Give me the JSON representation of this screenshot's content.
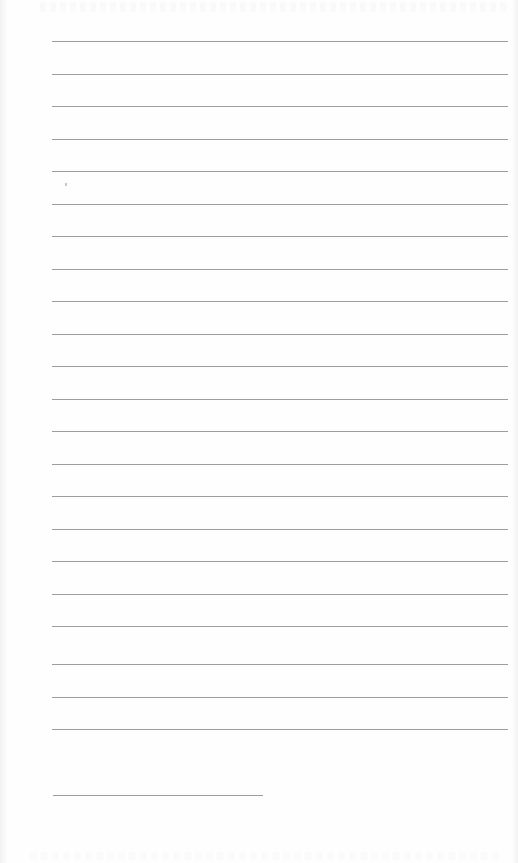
{
  "page": {
    "type": "blank lined page",
    "background": "#fefefe",
    "rule_color": "#8c8c8c",
    "rule_left": 52,
    "rule_right": 508,
    "rule_ys": [
      41,
      74,
      106,
      139,
      171,
      204,
      236,
      269,
      301,
      334,
      366,
      399,
      431,
      464,
      496,
      529,
      561,
      594,
      626,
      664,
      697,
      729
    ],
    "short_rule": {
      "y": 795,
      "left": 53,
      "right": 263
    }
  }
}
